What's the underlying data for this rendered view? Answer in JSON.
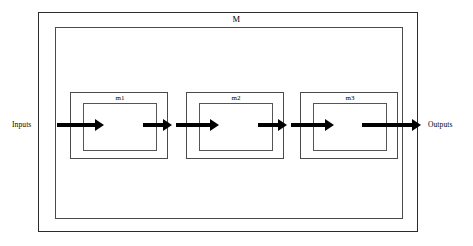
{
  "diagram": {
    "system": {
      "label": "M"
    },
    "io": {
      "input_label": "Inputs",
      "output_label": "Outputs"
    },
    "modules": [
      {
        "label": "m1"
      },
      {
        "label": "m2"
      },
      {
        "label": "m3"
      }
    ],
    "arrows": [
      {
        "name": "input-to-m1"
      },
      {
        "name": "m1-out"
      },
      {
        "name": "into-m2"
      },
      {
        "name": "m2-out"
      },
      {
        "name": "into-m3"
      },
      {
        "name": "m3-to-output"
      }
    ],
    "colors": {
      "background": "#ffffff",
      "line": "#2b2b2b",
      "module_border": "#4a4a4a",
      "arrow": "#000000",
      "text": "#000000"
    }
  }
}
